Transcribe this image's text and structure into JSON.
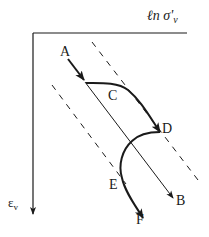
{
  "diagram": {
    "x_axis_label": "ℓn σ'",
    "x_axis_subscript": "v",
    "y_axis_label": "ε",
    "y_axis_subscript": "v",
    "points": {
      "A": "A",
      "B": "B",
      "C": "C",
      "D": "D",
      "E": "E",
      "F": "F"
    },
    "colors": {
      "ink": "#1a1a1a",
      "background": "#ffffff"
    }
  }
}
